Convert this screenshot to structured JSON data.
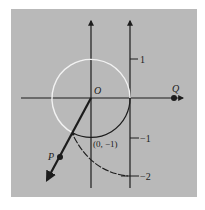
{
  "figure": {
    "background_color": "#b9b9b9",
    "ink_color": "#1c1c1c",
    "circle_highlight_color": "#f2f2f2",
    "labels": {
      "origin": "O",
      "point_q": "Q",
      "point_p": "P",
      "intersection": "(0, −1)",
      "tick_1": "1",
      "tick_neg1": "−1",
      "tick_neg2": "−2"
    },
    "elements": [
      {
        "name": "horizontal-axis",
        "kind": "arrow-line"
      },
      {
        "name": "vertical-axis",
        "kind": "arrow-line"
      },
      {
        "name": "tangent-number-line",
        "kind": "arrow-line",
        "ticks": [
          "1",
          "−1",
          "−2"
        ]
      },
      {
        "name": "unit-circle",
        "kind": "circle",
        "center": "O"
      },
      {
        "name": "ray-op",
        "kind": "arrow-line",
        "through": "P"
      },
      {
        "name": "wrapping-arc",
        "kind": "arc",
        "from": "(0, −1)",
        "to": "−2"
      }
    ]
  }
}
